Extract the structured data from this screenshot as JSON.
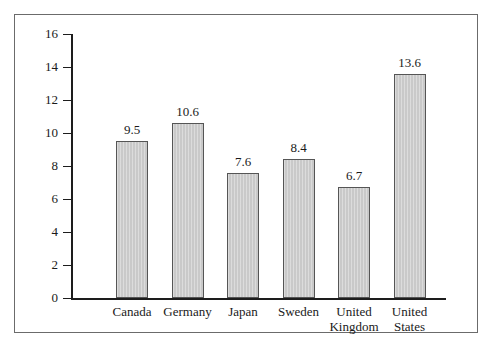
{
  "figure": {
    "background_color": "#ffffff",
    "frame_color": "#6b6b6b",
    "axis_color": "#1d1d1d",
    "bar_fill_color": "#c9c9c9",
    "bar_edge_color": "#555555"
  },
  "chart_data": {
    "type": "bar",
    "title": "",
    "subtitle": "",
    "xlabel": "",
    "ylabel": "",
    "categories": [
      "Canada",
      "Germany",
      "Japan",
      "Sweden",
      "United Kingdom",
      "United States"
    ],
    "category_lines": [
      [
        "Canada",
        ""
      ],
      [
        "Germany",
        ""
      ],
      [
        "Japan",
        ""
      ],
      [
        "Sweden",
        ""
      ],
      [
        "United",
        "Kingdom"
      ],
      [
        "United",
        "States"
      ]
    ],
    "values": [
      9.5,
      10.6,
      7.6,
      8.4,
      6.7,
      13.6
    ],
    "value_labels": [
      "9.5",
      "10.6",
      "7.6",
      "8.4",
      "6.7",
      "13.6"
    ],
    "ylim": [
      0,
      16
    ],
    "ytick_values": [
      0,
      2,
      4,
      6,
      8,
      10,
      12,
      14,
      16
    ],
    "ytick_labels": [
      "0",
      "2",
      "4",
      "6",
      "8",
      "10",
      "12",
      "14",
      "16"
    ],
    "grid": false,
    "legend": null,
    "annotations": []
  }
}
